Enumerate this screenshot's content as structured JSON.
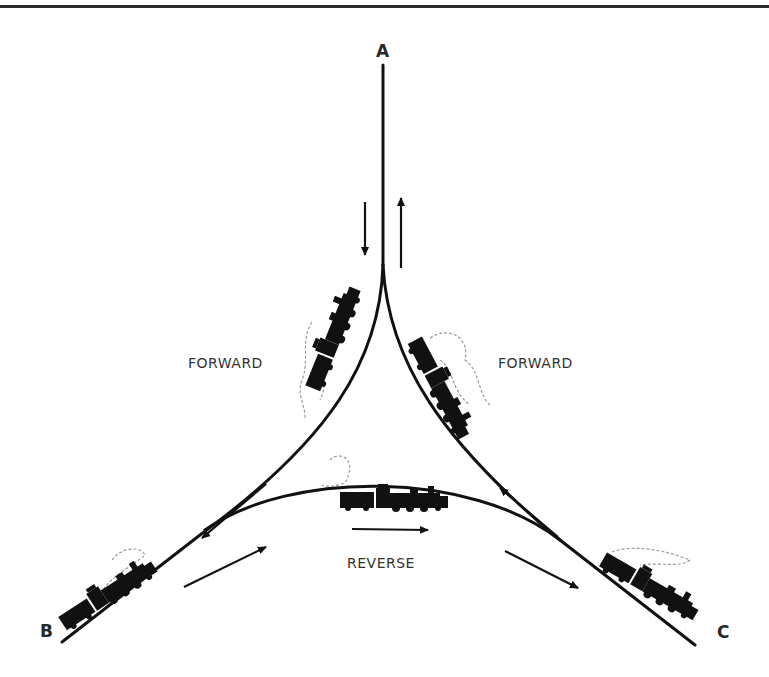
{
  "diagram": {
    "type": "railway triangle (wye) turning diagram",
    "points": {
      "a": "A",
      "b": "B",
      "c": "C"
    },
    "labels": {
      "forward_left": "FORWARD",
      "forward_right": "FORWARD",
      "reverse": "REVERSE"
    },
    "arrows": [
      {
        "near": "A-left",
        "direction": "down"
      },
      {
        "near": "A-right",
        "direction": "up"
      },
      {
        "near": "B-upper",
        "direction": "down-left"
      },
      {
        "near": "B-lower",
        "direction": "up-right"
      },
      {
        "near": "reverse-curve",
        "direction": "right"
      },
      {
        "near": "C-upper",
        "direction": "up-left"
      },
      {
        "near": "C-lower",
        "direction": "down-right"
      }
    ],
    "trains": [
      {
        "location": "left-forward-curve",
        "icon": "steam-locomotive-icon"
      },
      {
        "location": "right-forward-curve",
        "icon": "steam-locomotive-icon"
      },
      {
        "location": "reverse-curve",
        "icon": "steam-locomotive-icon"
      },
      {
        "location": "B-branch",
        "icon": "steam-locomotive-icon"
      },
      {
        "location": "C-branch",
        "icon": "steam-locomotive-icon"
      }
    ],
    "colors": {
      "ink": "#111111",
      "smoke": "#9a9a9a",
      "background": "#ffffff"
    }
  }
}
